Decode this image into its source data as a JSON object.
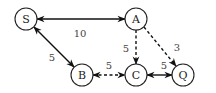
{
  "graph": {
    "nodes": [
      {
        "id": "S",
        "label": "S",
        "x": 26,
        "y": 19
      },
      {
        "id": "A",
        "label": "A",
        "x": 136,
        "y": 19
      },
      {
        "id": "B",
        "label": "B",
        "x": 82,
        "y": 75
      },
      {
        "id": "C",
        "label": "C",
        "x": 136,
        "y": 75
      },
      {
        "id": "Q",
        "label": "Q",
        "x": 183,
        "y": 75
      }
    ],
    "edges": [
      {
        "from": "S",
        "to": "A",
        "weight": "10",
        "style": "solid",
        "bidirectional": true
      },
      {
        "from": "S",
        "to": "B",
        "weight": "5",
        "style": "solid",
        "bidirectional": true
      },
      {
        "from": "A",
        "to": "C",
        "weight": "5",
        "style": "dashed",
        "bidirectional": false
      },
      {
        "from": "A",
        "to": "Q",
        "weight": "3",
        "style": "dashed",
        "bidirectional": false
      },
      {
        "from": "B",
        "to": "C",
        "weight": "5",
        "style": "dashed",
        "bidirectional": true
      },
      {
        "from": "C",
        "to": "Q",
        "weight": "5",
        "style": "solid",
        "bidirectional": true
      }
    ]
  }
}
